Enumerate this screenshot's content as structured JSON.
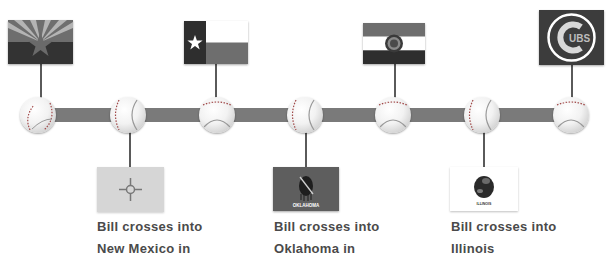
{
  "timeline": {
    "bar_color": "#7a7a7a",
    "baseball_count": 7,
    "stops": [
      {
        "position": 1,
        "side": "top",
        "flag_icon": "arizona-flag-icon",
        "state": "Arizona"
      },
      {
        "position": 2,
        "side": "bottom",
        "flag_icon": "new-mexico-flag-icon",
        "state": "New Mexico",
        "caption_line1": "Bill crosses into",
        "caption_line2": "New Mexico in"
      },
      {
        "position": 3,
        "side": "top",
        "flag_icon": "texas-flag-icon",
        "state": "Texas"
      },
      {
        "position": 4,
        "side": "bottom",
        "flag_icon": "oklahoma-flag-icon",
        "state": "Oklahoma",
        "flag_text": "OKLAHOMA",
        "caption_line1": "Bill crosses into",
        "caption_line2": "Oklahoma in"
      },
      {
        "position": 5,
        "side": "top",
        "flag_icon": "missouri-flag-icon",
        "state": "Missouri"
      },
      {
        "position": 6,
        "side": "bottom",
        "flag_icon": "illinois-flag-icon",
        "state": "Illinois",
        "flag_text": "ILLINOIS",
        "caption_line1": "Bill crosses into",
        "caption_line2": "Illinois"
      },
      {
        "position": 7,
        "side": "top",
        "flag_icon": "cubs-logo-icon",
        "state": "Chicago Cubs",
        "logo_text": "UBS"
      }
    ]
  }
}
